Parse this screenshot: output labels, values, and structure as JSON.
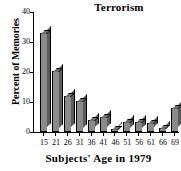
{
  "chart_data": {
    "type": "bar",
    "title": "Terrorism",
    "xlabel": "Subjects' Age in 1979",
    "ylabel": "Percent of Memories",
    "categories": [
      "15",
      "21",
      "26",
      "31",
      "36",
      "41",
      "46",
      "51",
      "56",
      "61",
      "66",
      "69"
    ],
    "values": [
      33,
      20.5,
      12,
      10.5,
      4,
      5,
      1,
      3.5,
      3.5,
      3,
      1.5,
      8
    ],
    "ylim": [
      0,
      40
    ],
    "yticks": [
      0,
      10,
      20,
      30,
      40
    ],
    "ytick_labels": [
      "0",
      "10",
      "20",
      "30",
      "40"
    ],
    "grid": false,
    "legend": false,
    "bar_color": "#8a8a8a",
    "bar_edge_color": "#000000",
    "bar_side_color": "#5a5a5a",
    "background": "#ffffff"
  }
}
